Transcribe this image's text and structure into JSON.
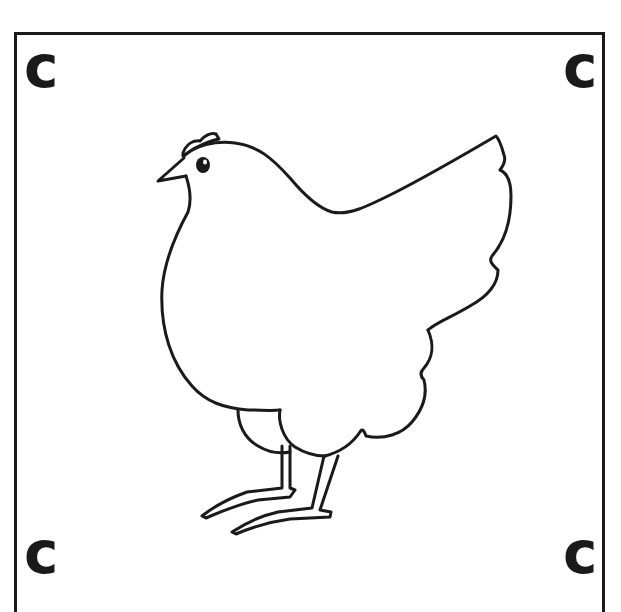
{
  "card": {
    "corner_letters": {
      "top_left": "c",
      "top_right": "c",
      "bottom_left": "c",
      "bottom_right": "c"
    },
    "illustration": "chicken-outline",
    "colors": {
      "ink": "#1a1a1a",
      "background": "#ffffff"
    }
  }
}
